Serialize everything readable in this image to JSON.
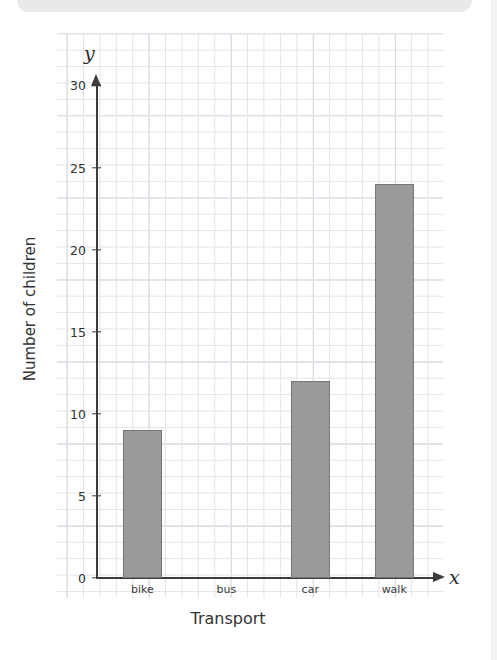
{
  "banner": {
    "name": "top-banner-strip"
  },
  "chart_data": {
    "type": "bar",
    "title": "",
    "categories": [
      "bike",
      "bus",
      "car",
      "walk"
    ],
    "values": [
      9,
      0,
      12,
      24
    ],
    "xlabel": "Transport",
    "ylabel": "Number of children",
    "x_axis_letter": "x",
    "y_axis_letter": "y",
    "ylim": [
      0,
      30
    ],
    "ytick_labels": [
      "0",
      "5",
      "10",
      "15",
      "20",
      "25",
      "30"
    ],
    "ytick_values": [
      0,
      5,
      10,
      15,
      20,
      25,
      30
    ],
    "minor_gridline_step": 1,
    "grid": true,
    "legend": "none",
    "bar_color": "#9a9a9a",
    "bar_edge_color": "#777777",
    "axis_color": "#3c3c3c",
    "grid_minor_color": "#e3e3ea",
    "grid_major_color": "#c9c9d4"
  }
}
